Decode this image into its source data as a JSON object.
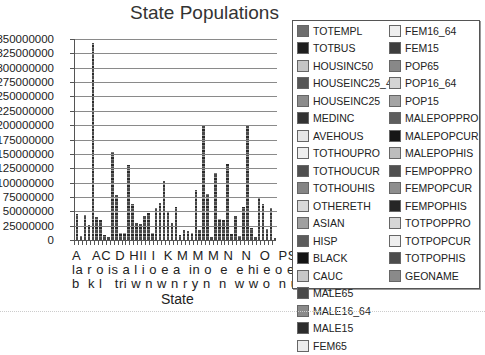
{
  "chart_data": {
    "type": "bar",
    "stacked": true,
    "title": "State Populations",
    "xlabel": "State",
    "ylabel": "",
    "ylim": [
      0,
      350000000
    ],
    "yticks": [
      "350000000",
      "325000000",
      "300000000",
      "275000000",
      "250000000",
      "225000000",
      "200000000",
      "175000000",
      "150000000",
      "125000000",
      "100000000",
      "75000000",
      "50000000",
      "25000000",
      "0"
    ],
    "grid": true,
    "legend_position": "right",
    "xtick_label_rows": [
      "A   AC D HII I  K M M M N  N  O  PS T U V W",
      "la r o is a l i o e a  in o  e  e hi e o e t  ir is",
      "b  k l   tri w n w n r y n  n  w w o  n u n a g  c"
    ],
    "categories": [
      "AL",
      "AK",
      "AZ",
      "AR",
      "CA",
      "CO",
      "CT",
      "DE",
      "DC",
      "FL",
      "GA",
      "HI",
      "ID",
      "IL",
      "IN",
      "IA",
      "KS",
      "KY",
      "LA",
      "ME",
      "MD",
      "MA",
      "MI",
      "MN",
      "MS",
      "MO",
      "MT",
      "NE",
      "NV",
      "NH",
      "NJ",
      "NM",
      "NY",
      "NC",
      "ND",
      "OH",
      "OK",
      "OR",
      "PA",
      "RI",
      "SC",
      "SD",
      "TN",
      "TX",
      "UT",
      "VT",
      "VA",
      "WA",
      "WV",
      "WI",
      "WY"
    ],
    "values": [
      45000000,
      7000000,
      43000000,
      27000000,
      343000000,
      40000000,
      35000000,
      8000000,
      6000000,
      153000000,
      78000000,
      12000000,
      12000000,
      130000000,
      63000000,
      30000000,
      28000000,
      42000000,
      47000000,
      13000000,
      55000000,
      65000000,
      103000000,
      50000000,
      30000000,
      58000000,
      8000000,
      18000000,
      16000000,
      13000000,
      87000000,
      17000000,
      200000000,
      80000000,
      6000000,
      117000000,
      36000000,
      35000000,
      133000000,
      10000000,
      42000000,
      7000000,
      58000000,
      200000000,
      21000000,
      6000000,
      74000000,
      62000000,
      19000000,
      55000000,
      4000000
    ],
    "series": [
      {
        "name": "TOTEMPL",
        "color": "#6e6e6e"
      },
      {
        "name": "TOTBUS",
        "color": "#1e1e1e"
      },
      {
        "name": "HOUSINC50",
        "color": "#c4c4c4"
      },
      {
        "name": "HOUSEINC25_49",
        "color": "#555555"
      },
      {
        "name": "HOUSEINC25",
        "color": "#8c8c8c"
      },
      {
        "name": "MEDINC",
        "color": "#333333"
      },
      {
        "name": "AVEHOUS",
        "color": "#e6e6e6"
      },
      {
        "name": "TOTHOUPRO",
        "color": "#eeeeee"
      },
      {
        "name": "TOTHOUCUR",
        "color": "#505050"
      },
      {
        "name": "TOTHOUHIS",
        "color": "#858585"
      },
      {
        "name": "OTHERETH",
        "color": "#d8d8d8"
      },
      {
        "name": "ASIAN",
        "color": "#a0a0a0"
      },
      {
        "name": "HISP",
        "color": "#5c5c5c"
      },
      {
        "name": "BLACK",
        "color": "#141414"
      },
      {
        "name": "CAUC",
        "color": "#c8c8c8"
      },
      {
        "name": "MALE65",
        "color": "#4a4a4a"
      },
      {
        "name": "MALE16_64",
        "color": "#8a8a8a"
      },
      {
        "name": "MALE15",
        "color": "#2c2c2c"
      },
      {
        "name": "FEM65",
        "color": "#ececec"
      },
      {
        "name": "FEM16_64",
        "color": "#eeeeee"
      },
      {
        "name": "FEM15",
        "color": "#3e3e3e"
      },
      {
        "name": "POP65",
        "color": "#888888"
      },
      {
        "name": "POP16_64",
        "color": "#d4d4d4"
      },
      {
        "name": "POP15",
        "color": "#a4a4a4"
      },
      {
        "name": "MALEPOPPRO",
        "color": "#5e5e5e"
      },
      {
        "name": "MALEPOPCUR",
        "color": "#161616"
      },
      {
        "name": "MALEPOPHIS",
        "color": "#bdbdbd"
      },
      {
        "name": "FEMPOPPRO",
        "color": "#505050"
      },
      {
        "name": "FEMPOPCUR",
        "color": "#8e8e8e"
      },
      {
        "name": "FEMPOPHIS",
        "color": "#262626"
      },
      {
        "name": "TOTPOPPRO",
        "color": "#d6d6d6"
      },
      {
        "name": "TOTPOPCUR",
        "color": "#eeeeee"
      },
      {
        "name": "TOTPOPHIS",
        "color": "#4c4c4c"
      },
      {
        "name": "GEONAME",
        "color": "#8a8a8a"
      }
    ]
  }
}
